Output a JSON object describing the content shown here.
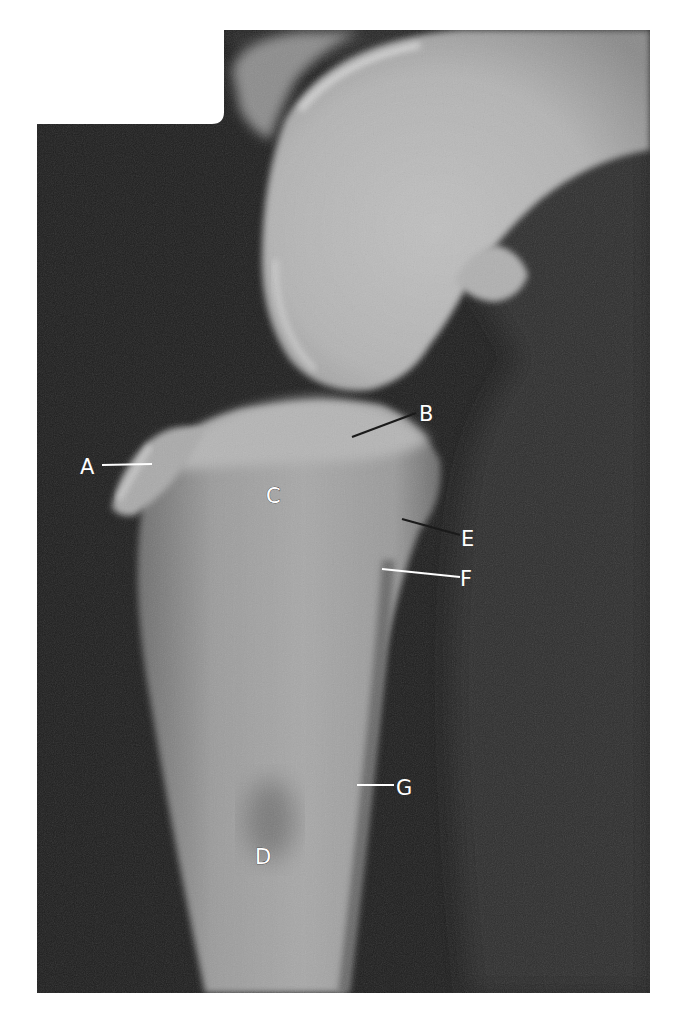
{
  "image": {
    "description": "Lateral radiograph of stifle (knee) joint with labeled anatomical structures",
    "background_color": "#ffffff",
    "film_color": "#1c1c1c"
  },
  "labels": [
    {
      "id": "A",
      "text": "A",
      "x": 80,
      "y": 474
    },
    {
      "id": "B",
      "text": "B",
      "x": 419,
      "y": 421
    },
    {
      "id": "C",
      "text": "C",
      "x": 266,
      "y": 503
    },
    {
      "id": "D",
      "text": "D",
      "x": 255,
      "y": 864
    },
    {
      "id": "E",
      "text": "E",
      "x": 461,
      "y": 546
    },
    {
      "id": "F",
      "text": "F",
      "x": 460,
      "y": 586
    },
    {
      "id": "G",
      "text": "G",
      "x": 396,
      "y": 795
    }
  ]
}
